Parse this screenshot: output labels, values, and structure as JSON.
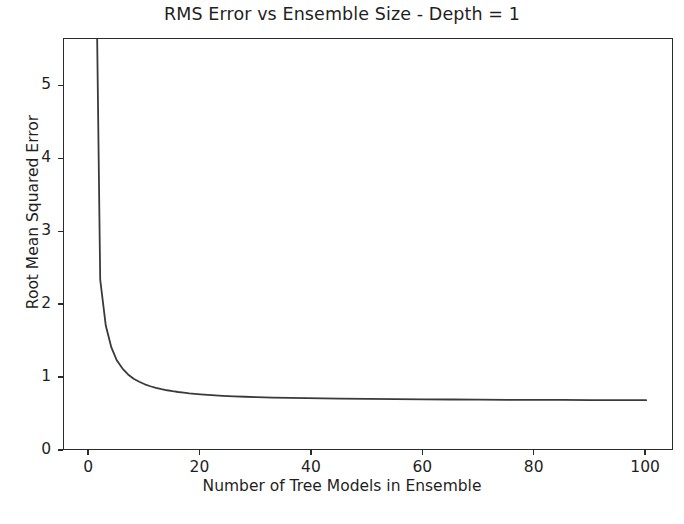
{
  "chart_data": {
    "type": "line",
    "title": "RMS Error vs Ensemble Size - Depth = 1",
    "xlabel": "Number of Tree Models in Ensemble",
    "ylabel": "Root Mean Squared Error",
    "xlim": [
      -4.5,
      105
    ],
    "ylim": [
      0,
      5.65
    ],
    "xticks": [
      0,
      20,
      40,
      60,
      80,
      100
    ],
    "xtick_labels": [
      "0",
      "20",
      "40",
      "60",
      "80",
      "100"
    ],
    "yticks": [
      0,
      1,
      2,
      3,
      4,
      5
    ],
    "ytick_labels": [
      "0",
      "1",
      "2",
      "3",
      "4",
      "5"
    ],
    "grid": false,
    "legend": null,
    "line_color": "#3a3a3a",
    "line_width": 1.8,
    "series": [
      {
        "name": "RMSE",
        "x": [
          1,
          2,
          3,
          4,
          5,
          6,
          7,
          8,
          9,
          10,
          11,
          12,
          13,
          14,
          15,
          16,
          17,
          18,
          19,
          20,
          22,
          24,
          26,
          28,
          30,
          33,
          36,
          39,
          42,
          45,
          50,
          55,
          60,
          65,
          70,
          75,
          80,
          85,
          90,
          95,
          100
        ],
        "y": [
          8.4,
          2.35,
          1.72,
          1.42,
          1.24,
          1.13,
          1.05,
          0.99,
          0.95,
          0.915,
          0.888,
          0.866,
          0.848,
          0.833,
          0.82,
          0.809,
          0.8,
          0.791,
          0.784,
          0.777,
          0.766,
          0.757,
          0.75,
          0.744,
          0.739,
          0.733,
          0.728,
          0.724,
          0.721,
          0.718,
          0.714,
          0.711,
          0.708,
          0.706,
          0.704,
          0.702,
          0.701,
          0.7,
          0.699,
          0.698,
          0.697
        ]
      }
    ]
  },
  "caption": ""
}
